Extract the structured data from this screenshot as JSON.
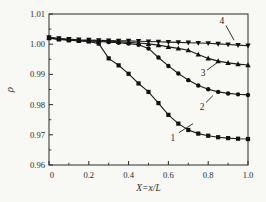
{
  "figure": {
    "kind": "scanned line chart",
    "background": "#f8f8f5"
  },
  "chart_data": {
    "type": "line",
    "title": "",
    "xlabel": "X=x/L",
    "ylabel": "ρ",
    "xlim": [
      0,
      1.0
    ],
    "ylim": [
      0.96,
      1.01
    ],
    "grid": false,
    "legend": "inline numeric labels with leader lines",
    "x_tick_values": [
      0,
      0.2,
      0.4,
      0.6,
      0.8,
      1.0
    ],
    "x_tick_labels": [
      "0",
      "0.2",
      "0.4",
      "0.6",
      "0.8",
      "1.0"
    ],
    "x_minor_tick_values": [
      0.1,
      0.3,
      0.5,
      0.7,
      0.9
    ],
    "y_tick_values": [
      0.96,
      0.97,
      0.98,
      0.99,
      1.0,
      1.01
    ],
    "y_tick_labels": [
      "0.96",
      "0.97",
      "0.98",
      "0.99",
      "1.00",
      "1.01"
    ],
    "y_minor_tick_values": [
      0.965,
      0.975,
      0.985,
      0.995,
      1.005
    ],
    "x": [
      0,
      0.05,
      0.1,
      0.15,
      0.2,
      0.25,
      0.3,
      0.35,
      0.4,
      0.45,
      0.5,
      0.55,
      0.6,
      0.65,
      0.7,
      0.75,
      0.8,
      0.85,
      0.9,
      0.95,
      1.0
    ],
    "series": [
      {
        "name": "1",
        "marker": "square",
        "values": [
          1.002,
          1.0016,
          1.0013,
          1.0011,
          1.0009,
          1.0002,
          0.9953,
          0.993,
          0.9902,
          0.987,
          0.9842,
          0.9805,
          0.9766,
          0.9737,
          0.9716,
          0.9704,
          0.9697,
          0.9692,
          0.9689,
          0.9687,
          0.9686
        ]
      },
      {
        "name": "2",
        "marker": "circle",
        "values": [
          1.0021,
          1.0017,
          1.0014,
          1.0012,
          1.0011,
          1.0009,
          1.0007,
          1.0005,
          1.0002,
          0.9998,
          0.9986,
          0.9956,
          0.9928,
          0.9903,
          0.9881,
          0.9863,
          0.9851,
          0.9842,
          0.9837,
          0.9834,
          0.9832
        ]
      },
      {
        "name": "3",
        "marker": "triangle-up",
        "values": [
          1.0022,
          1.0018,
          1.0015,
          1.0013,
          1.0012,
          1.0011,
          1.001,
          1.0008,
          1.0006,
          1.0004,
          1.0001,
          0.9997,
          0.9991,
          0.9986,
          0.998,
          0.9966,
          0.9953,
          0.9944,
          0.9938,
          0.9934,
          0.9931
        ]
      },
      {
        "name": "4",
        "marker": "triangle-down",
        "values": [
          1.0023,
          1.0019,
          1.0017,
          1.0015,
          1.0014,
          1.0013,
          1.0012,
          1.0011,
          1.0011,
          1.001,
          1.0009,
          1.0008,
          1.0007,
          1.0006,
          1.0005,
          1.0004,
          1.0003,
          1.0001,
          0.9999,
          0.9997,
          0.9995
        ]
      }
    ],
    "annotations": [
      {
        "label": "1",
        "text_x": 0.623,
        "text_y": 0.9689,
        "leader": [
          0.653,
          0.9707,
          0.724,
          0.9737
        ]
      },
      {
        "label": "2",
        "text_x": 0.769,
        "text_y": 0.9792,
        "leader": [
          0.789,
          0.9807,
          0.824,
          0.983
        ]
      },
      {
        "label": "3",
        "text_x": 0.774,
        "text_y": 0.9905,
        "leader": [
          0.794,
          0.9914,
          0.849,
          0.9941
        ]
      },
      {
        "label": "4",
        "text_x": 0.869,
        "text_y": 1.0077,
        "leader": [
          0.889,
          1.0062,
          0.93,
          1.0013
        ]
      }
    ],
    "colors": {
      "line": "#1c1c1c",
      "marker": "#111111",
      "text": "#2b2b2b",
      "spine": "#2b2b2b",
      "background": "#f8f8f5"
    }
  }
}
